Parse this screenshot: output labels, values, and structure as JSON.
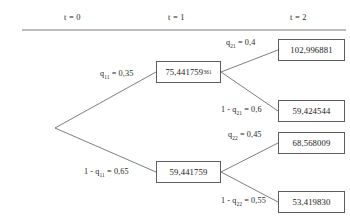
{
  "header": {
    "columns": [
      {
        "label": "t = 0"
      },
      {
        "label": "t = 1"
      },
      {
        "label": "t = 2"
      }
    ]
  },
  "nodes": [
    {
      "id": "root",
      "value": "",
      "superscript": ""
    },
    {
      "id": "up1",
      "value": "75,441759",
      "superscript": "361"
    },
    {
      "id": "down1",
      "value": "59,441759",
      "superscript": ""
    },
    {
      "id": "uu2",
      "value": "102,996881",
      "superscript": ""
    },
    {
      "id": "ud2",
      "value": "59,424544",
      "superscript": ""
    },
    {
      "id": "du2",
      "value": "68,568009",
      "superscript": ""
    },
    {
      "id": "dd2",
      "value": "53,419830",
      "superscript": ""
    }
  ],
  "edges": [
    {
      "id": "root-up",
      "label_prefix": "q",
      "label_sub": "11",
      "label_suffix": " = 0,35",
      "full": "q11 = 0,35"
    },
    {
      "id": "root-down",
      "label_prefix": "1 - q",
      "label_sub": "11",
      "label_suffix": " = 0,65",
      "full": "1 - q11 = 0,65"
    },
    {
      "id": "up-uu",
      "label_prefix": "q",
      "label_sub": "21",
      "label_suffix": " = 0,4",
      "full": "q21 = 0,4"
    },
    {
      "id": "up-ud",
      "label_prefix": "1 - q",
      "label_sub": "21",
      "label_suffix": " = 0,6",
      "full": "1 - q21 = 0,6"
    },
    {
      "id": "down-du",
      "label_prefix": "q",
      "label_sub": "22",
      "label_suffix": " = 0,45",
      "full": "q22 = 0,45"
    },
    {
      "id": "down-dd",
      "label_prefix": "1 - q",
      "label_sub": "22",
      "label_suffix": " = 0,55",
      "full": "1 - q22 = 0,55"
    }
  ],
  "colors": {
    "line": "#5d5d5d",
    "box_border": "#5d5d5d",
    "text": "#1a1a1a",
    "rule": "#6b6b6b"
  },
  "caption": {
    "text": ""
  }
}
